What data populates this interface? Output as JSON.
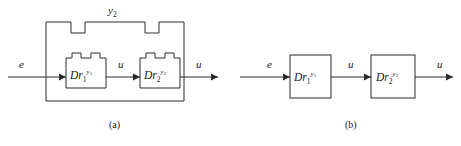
{
  "figure": {
    "background": "#ffffff",
    "line_color": "#2b2b2b",
    "text_color": "#1a1a1a",
    "panels": [
      {
        "id": "a",
        "caption": "(a)",
        "type": "feedback-loop",
        "feedback_label": "y",
        "feedback_label_sub": "2",
        "signals": {
          "input": "e",
          "middle": "u",
          "output": "u"
        },
        "blocks": [
          {
            "id": "a-block-1",
            "base": "Dr",
            "sub": "1",
            "sup_base": "y",
            "sup_sub": "1",
            "shape": "notched"
          },
          {
            "id": "a-block-2",
            "base": "Dr",
            "sub": "2",
            "sup_base": "y",
            "sup_sub": "2",
            "shape": "notched"
          }
        ]
      },
      {
        "id": "b",
        "caption": "(b)",
        "type": "cascade",
        "signals": {
          "input": "e",
          "middle": "u",
          "output": "u"
        },
        "blocks": [
          {
            "id": "b-block-1",
            "base": "Dr",
            "sub": "1",
            "sup_base": "y",
            "sup_sub": "1",
            "shape": "rectangle"
          },
          {
            "id": "b-block-2",
            "base": "Dr",
            "sub": "2",
            "sup_base": "y",
            "sup_sub": "2",
            "shape": "rectangle"
          }
        ]
      }
    ]
  }
}
